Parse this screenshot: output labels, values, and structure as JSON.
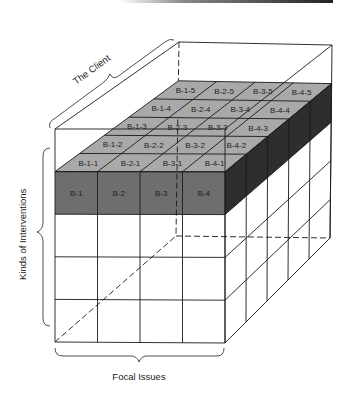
{
  "diagram": {
    "type": "3d-cube-matrix",
    "axes": {
      "width_label": "Focal Issues",
      "height_label": "Kinds of Interventions",
      "depth_label": "The Client"
    },
    "dimensions": {
      "columns": 4,
      "rows": 5,
      "depth": 5
    },
    "highlighted_row": 2,
    "front_labels": [
      "B-1",
      "B-2",
      "B-3",
      "B-4"
    ],
    "top_labels": [
      [
        "B-1-1",
        "B-2-1",
        "B-3-1",
        "B-4-1"
      ],
      [
        "B-1-2",
        "B-2-2",
        "B-3-2",
        "B-4-2"
      ],
      [
        "B-1-3",
        "B-2-3",
        "B-3-3",
        "B-4-3"
      ],
      [
        "B-1-4",
        "B-2-4",
        "B-3-4",
        "B-4-4"
      ],
      [
        "B-1-5",
        "B-2-5",
        "B-3-5",
        "B-4-5"
      ]
    ],
    "colors": {
      "front_slab": "#6e6e6e",
      "top_slab": "#a9a9a9",
      "side_slab": "#2e2e2e",
      "line": "#1a1a1a",
      "background": "#ffffff"
    }
  }
}
